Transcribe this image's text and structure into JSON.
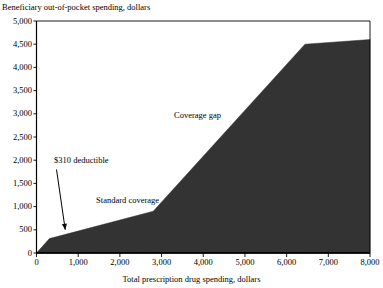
{
  "chart_data": {
    "type": "area",
    "title": "",
    "xlabel": "Total prescription drug spending, dollars",
    "ylabel": "Beneficiary out-of-pocket spending, dollars",
    "xlim": [
      0,
      8000
    ],
    "ylim": [
      0,
      5000
    ],
    "xticks": [
      "0",
      "1,000",
      "2,000",
      "3,000",
      "4,000",
      "5,000",
      "6,000",
      "7,000",
      "8,000"
    ],
    "xtick_values": [
      0,
      1000,
      2000,
      3000,
      4000,
      5000,
      6000,
      7000,
      8000
    ],
    "yticks": [
      "0",
      "500",
      "1,000",
      "1,500",
      "2,000",
      "2,500",
      "3,000",
      "3,500",
      "4,000",
      "4,500",
      "5,000"
    ],
    "ytick_values": [
      0,
      500,
      1000,
      1500,
      2000,
      2500,
      3000,
      3500,
      4000,
      4500,
      5000
    ],
    "grid": false,
    "legend": "none",
    "series": [
      {
        "name": "Beneficiary out-of-pocket spending",
        "fill_color": "#333333",
        "x": [
          0,
          310,
          2800,
          6440,
          8000
        ],
        "y": [
          0,
          310,
          900,
          4500,
          4600
        ]
      }
    ],
    "annotations": [
      {
        "name": "deductible",
        "text": "$310 deductible",
        "x": 420,
        "y": 1980,
        "color": "#000000",
        "arrow": {
          "from_x": 480,
          "from_y": 1800,
          "to_x": 690,
          "to_y": 500
        }
      },
      {
        "name": "standard-coverage",
        "text": "Standard coverage",
        "x": 1430,
        "y": 1120,
        "color": "#000000"
      },
      {
        "name": "coverage-gap",
        "text": "Coverage gap",
        "x": 3300,
        "y": 2960,
        "color": "#000000"
      },
      {
        "name": "catastrophic-coverage",
        "text": "Catastrophic coverage",
        "x": 5550,
        "y": 4810,
        "color": "#ffffff"
      }
    ]
  },
  "colors": {
    "axis": "#000000",
    "fill": "#333333",
    "background": "#ffffff"
  }
}
